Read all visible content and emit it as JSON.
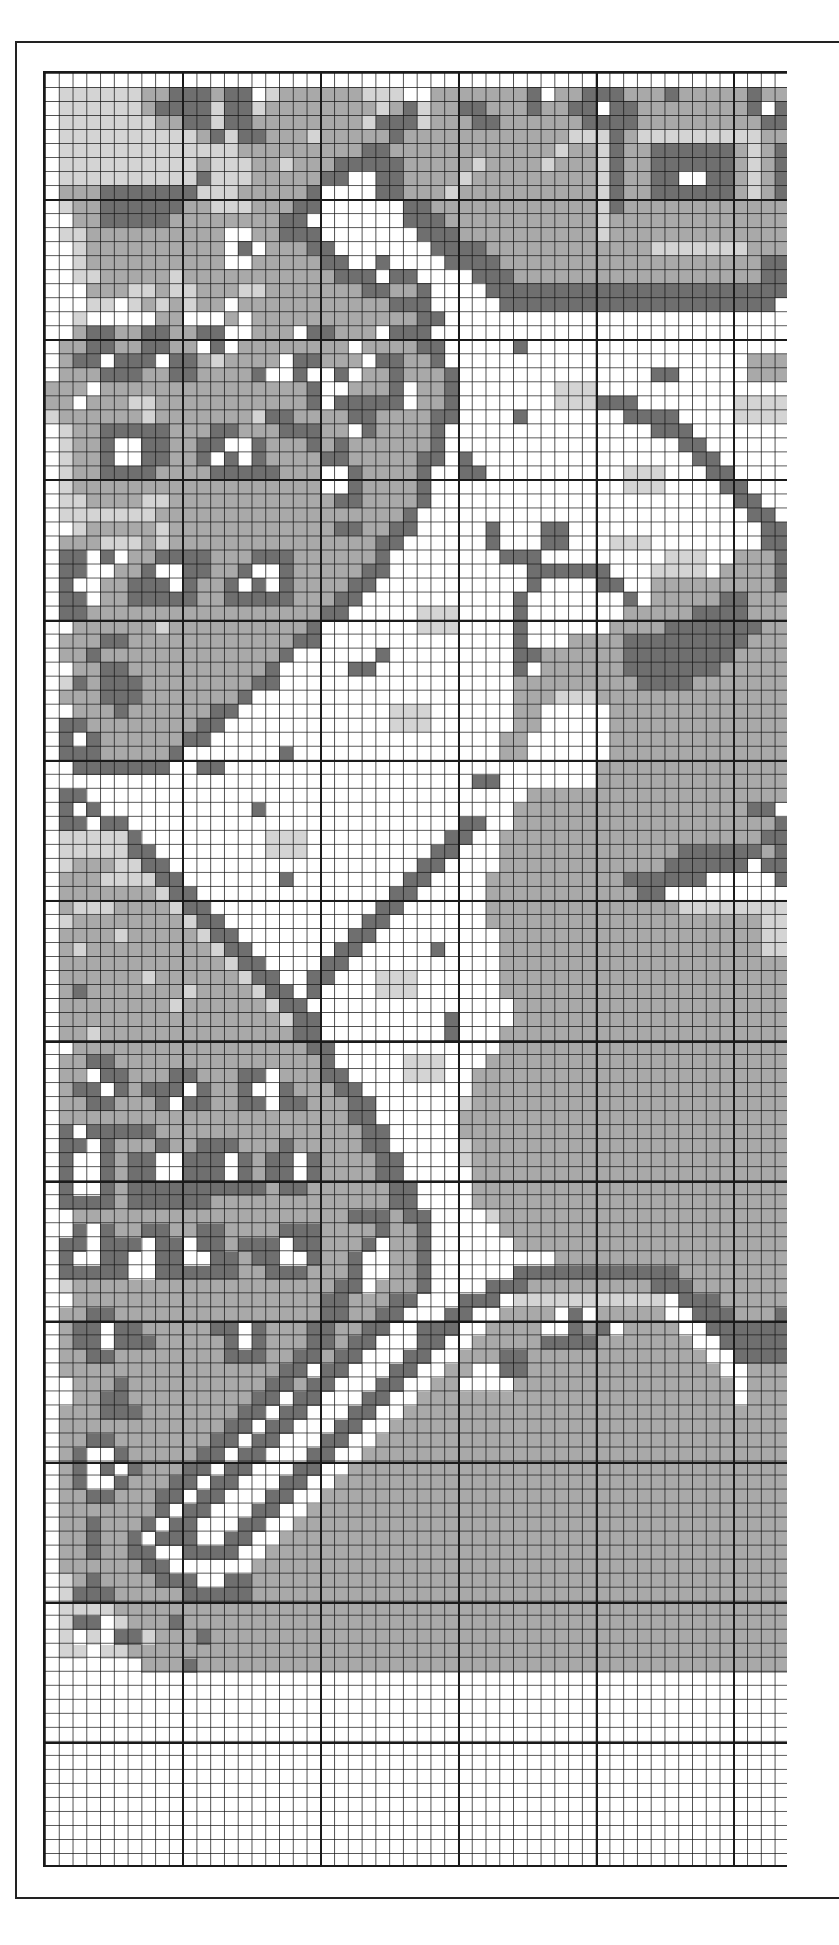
{
  "chart_data": {
    "type": "heatmap",
    "title": "",
    "columns": 54,
    "rows": 128,
    "heavy_line_every": 10,
    "heavy_col_offset": 10,
    "heavy_row_offset": 9,
    "legend": {
      ".": {
        "name": "white",
        "color": "#ffffff"
      },
      "l": {
        "name": "light-gray",
        "color": "#d4d4d4"
      },
      "m": {
        "name": "medium-gray",
        "color": "#a9a9a9"
      },
      "d": {
        "name": "dark-gray",
        "color": "#6f6f6f"
      }
    },
    "grid": [
      "......................................................",
      ".llllllmmdddmdd.lmmmmmmlll..mmmmmmmd.mmdddmmmdmmmmmdmm",
      ".llllllmddddlddlmmmmmmmmlmdlmmddmmmdmmdd.ddmmmmmmmmd.d",
      ".lllllllmmddlddmmmmmmmmldddlmmmddmmmmmmddddmmmmmmmmmdd",
      ".llllllllllmdlddmmmlmmmmmdmmmmmmmmmmmmllldmlllllllllmm",
      ".lllllllllllllmmmmmmmmmddmmmmmmmmmmmmlmmldmmddddddmlmd",
      ".llllllllllmlllmmlmmmdddddmmmmmlmmmmlmmmldmmddddddmlmd",
      ".lllllllllldlllmmmmmdd..ddmmmmlmmmmmmmmmldmmdd..ddmlmd",
      ".mmmdddddddlllmmmmmd....ddmmmlmmmmmmmmmmldmmddddddmlmd",
      ".lmmddddddmmlllmmmdd......ddmmmmmmmmmmmmldmmmmmmmmmmmm",
      "..mmdddddmmmmmmmmdd.......dddmmmmmmmmmmmlmmmmmmmmmmmmm",
      ".llmmmmmmmmmm..mmddd.......dddmmmmmmmmmmlmmmmmmmmmmmmm",
      "..lmmmmmmmmmm.d.mmmdd.......ddddmmmmmmmmmmmmlllllllmmm",
      "..lmmmmmmmmmm..mmmmmdd..d....ddddmmmmmmmmmmmmmmmmmmmdd",
      "..llmmmmmlmmmmmmmmmmmddd.dd....dddmmmmmmmmmmmmmmmmmmdd",
      "...mmmllmllmmmllmmmmmmmddmmd....dddddddddddddddddddddd",
      "...ll.lmlmlmm.mmmmmmmmmmmddd.....dddddddddddddddddddd.",
      "..l.....mm...m.mmmmmmmmmmmmdd.........................",
      "..mddmmddmmdd..mmm.ddmmm.ddd..........................",
      ".mmddmmddmm.d.mmmmmmmm.mmmmdd.....d...................",
      ".mdd.ddd.ddmlmmmm.ddmmm.ddmmd......................mmm",
      ".mmmdddmmddmmmmd..d..d.mmdmmmd..............dd.....mmm",
      "mmm.mmmmmmmmmmmmmmmd..mmmd.mmd.......lll..............",
      "mm.mmmllmmmmmmmmmmmd.ddddd.mmd.......lllddd.......llll",
      "lmmmmmmlmmmmmmmlddmmmmddmmmmdd....d.......dddd....llll",
      ".lmmdddddmmmddmmmdddmm.dmmmmd...............ddd.......",
      ".lmmd..ddmmdd..dmmmdmdmmmmmmd.................dd......",
      ".lmmd..ddmmd.d.dmmmmddmmmmmdd.d................dd.....",
      ".lmmddddmmmmdddddmmm..dmmmmd..dd..........lll...dd....",
      ".lmmmmmmmmmmmmmmmmmm..dmmmmd..............lll....dd...",
      ".llmmmmllmmmmmmmmmmmmddmmmmd......................dd..",
      ".lllllllmmmmmmmmmmmmmmmmmmd........................dd.",
      "..lmmmmmlmmmmmmmmmmmmddmmdd.....d...dd..............dd",
      ".mmmlllmlmmmmmmmmmmmmmmmdd......d...dd...lll........dd",
      ".dd.d.mmddddmmmdddmmmmmmd........ddd.........lll..mmmd",
      ".dd..mmd..ddmmd..dmmmmmdd..........dddddd...llll.mmmmd",
      ".d..mmddd.dmmd.d.dmmmmdd...........d....dd..mmmmmmmmmd",
      ".dd.mmdddddmmdddddmmmdd...........d.......d.mmmmmddmmm",
      ".ddmmmmmmmmmmmmmmmmmdd.....lll....d.......mmmmmddddmmm",
      "..mmmmmmlmmmmmmmmmmd.......lll....d......mmmmdddddddmm",
      ".mmmddmmmmmmmmmmmmdd..............d...mmmmdddddddddmmm",
      ".mmdmmmmmmmmmmmmmd......d.........ddmmmmmmddddddddmmmm",
      "..mmddmmmmmmmmmmd.....dd..........d.mmmmmmdddddddmmmmm",
      ".ldmdddmmmmmmmmdd.................mmmmmmmmmddddmmmmmmm",
      ".mmmdddmmmmmmmd...................mmmlllmmmmmmmmmmmmmm",
      "..mmmdmmmmmmdd...........lll......mm.....mmmmmmmmmmmmm",
      ".ddmmmmmmmmdd............lll......mm.....mmmmmmmmmmmmm",
      ".d.dmmmmmmdd.....................mm......mmmmmmmmmmmmm",
      ".dddmmmmmd.......d...............mm......mmmmmmmmmmmmm",
      "..ddddddd..dd...........................mmmmmmmmmmmmmm",
      "...............................dd.......mmmmmmmmmmmmmm",
      ".dd................................mmmmmmmmmmmmmmmmmmm",
      ".d.d...........d..................mmmmmmmmmmmmmmmmmdd",
      ".dd.dd........................dd..mmmmmmmmmmmmmmmmmmmd",
      ".llllld.........lll..........dd..mmmmmmmmmmmmmmmmmmmdd",
      ".llllldd........lll.........dd...mmmmmmmmmmmmmddddddmd",
      ".lmmmlldd..................dd....mmmmmmmmmmmmdddddd.dd",
      ".mmmlllldd.......d........dd....mmmmmmmmmmdddddd.....d",
      ".mmmmmmmldd..............dd.....mmmmmmmmmmmdd.........",
      ".mlllmmmmldd............dd......mmmmmmmmmmmmmmllllllll",
      ".lmmmmmmmmldd..........dd.......mmmmmmmmmmmmmmmmmmmmll",
      ".mmmmlmmmmmldd........dd.........mmmmmmmmmmmmmmmmmmmll",
      ".mlmmmmmmmmmldd......dd.....d....mmmmmmmmmmmmmmmmmmmll",
      ".mmmmmmmmmmmmldd....dd...........mmmmmmmmmmmmmmmmmmmmm",
      ".mmmmmmlmmmmmmldd..dd...lll......mmmmmmmmmmmmmmmmmmmmm",
      ".mdmmmmmmmlmmmmldd.d....lll......mmmmmmmmmmmmmmmmmmmmm",
      ".mmmmmmmmlmmmmmmldd...............mmmmmmmmmmmmmmmmmmmm",
      ".mmmmmmmmmmmmmmmmldd.........d....mmmmmmmmmmmmmmmmmmmm",
      ".mmlmmmmmmmmmmmmmmdd.........d...mmmmmmmmmmmmmmmmmmmmm",
      "..mmmmmmmmmmmmmmmmmdd............mmmmmmmmmmmmmmmmmmmmm",
      ".mmddmmmmmmmmmmmmmmmd.....lll...mmmmmmmmmmmmmmmmmmmmmm",
      ".mm.ddmmmddmmmdd.mmmdd....lll..mmmmmmmmmmmmmmmmmmmmmmm",
      ".mdd.dmddd.dmmd..dmmmdd........mmmmmmmmmmmmmmmmmmmmmmm",
      ".mmddmmmd.ddmmdd.ddmmmdd......lmmmmmmmmmmmmmmmmmmmmmmm",
      ".mmmmmmmmmmmmmmmmmmmmmdd......mmmmmmmmmmmmmmmmmmmmmmmm",
      ".d.dddddmmmmmmmmmmmmmmmdd.....mmmmmmmmmmmmmmmmmmmmmmmm",
      ".dd.dmmmdmmdddmmmdmmmmmdd.....lmmmmmmmmmmmmmmmmmmmmmmm",
      ".d..dmdd..ddd.dmdd.dmmmmdd....lmmmmmmmmmmmmmmmmmmmmmmm",
      ".d..dmdd..ddd.dmdd.dmmmmdd.....mmmmmmmmmmmmmmmmmmmmmmm",
      ".d..dmddddddddddmddmmmmmmdd....mmmmmmmmmmmmmmmmmmmmmmm",
      ".ddddmddddddmmmmmmmmmmmmmdd....mmmmmmmmmmmmmmmmmmmmmmm",
      "..mmmmmmmmmmmmmmmmmmmmdddmdd....lmmmmmmmmmmmmmmmmmmmmm",
      "..d.dmmddmmddmmmmdddmmmmdmmd.....mmmmmmmmmmmmmmmmmmmmm",
      ".dd.ddd.dd.ddmddd.ddmmmd.mmd......mmmmmmmmmmmmmmmmmmmm",
      ".d..dd..dd..ddmdd..dmmd..mmd.........mmmmmmmmmmmmmmmmm",
      ".ddddd..ddddddmmdddmmmd..mmd......ddddddddddddmmmmmmmm",
      ".lmmmmmmmmmmmmmmmmmmmdd.mmmd....dddmmmmmmmmmdddmmmmmmm",
      "..mmmmmmmmmmmmmmmmmmddmmmdd...ddd.lllllllllll.dddmmmmm",
      ".mmddmmmmmmmmmmmmmmmddmmdd...dd..mmmm.d.mmmmm..dddmmmd",
      ".mdd.ddmmmmmdd.dmmmddmmdd..ddd..mmmm..dmd.mmmm..dddddd",
      ".mdd.dddmmmmmd.dmmmddmdd...dd..mmmmmddddmmmmmmm..ddddd",
      ".mmddmmmmmmmmdddmmddmdd...dd..mmmddmmmmmmmmmmmmm..dddd",
      ".mmmmmmmmmmmmmmmmdd.dd...dd..mm..ddmmmmmmmmmmmmmm..mmm",
      "..mmmdmmmmmmmmmmddmdd...dd..mm....mmmmmmmmmmmmmmmm.mmm",
      "..mmddmmmmmmmmmdd.dd...dd..mmmmmmmmmmmmmmmmmmmmmmm.mmm",
      ".mmmdddmmmmmmmdd.dd...dd..mmmmmmmmmmmmmmmmmmmmmmmmmmmm",
      ".mmmmmmmmmmmmdd.dd...dd..mmmmmmmmmmmmmmmmmmmmmmmmmmmmm",
      ".mmddmmmmmmmdd.dd...dd..mmmmmmmmmmmmmmmmmmmmmmmmmmmmmm",
      ".md..dmmmmmdd.dd...dd..mmmmmmmmmmmmmmmmmmmmmmmmmmmmmmm",
      ".md.d.dmmmdd.dd...dd..mmmmmmmmmmmmmmmmmmmmmmmmmmmmmmmm",
      ".md..dmmmdd.dd...dd..mmmmmmmmmmmmmmmmmmmmmmmmmmmmmmmmm",
      ".mmddmmmdd.dd...dd..mmmmmmmmmmmmmmmmmmmmmmmmmmmmmmmmmm",
      ".mmmmmmmd.dd...dd..mmmmmmmmmmmmmmmmmmmmmmmmmmmmmmmmmmm",
      ".mmdmmmd.dd...dd..mmmmmmmmmmmmmmmmmmmmmmmmmmmmmmmmmmmm",
      ".mmdmmd.ddd..dd..mmmmmmmmmmmmmmmmmmmmmmmmmmmmmmmmmmmmm",
      ".mmdmmdd..dddd..mmmmmmmmmmmmmmmmmmmmmmmmmmmmmmmmmmmmmm",
      ".mmmmmmdd......mmmmmmmmmmmmmmmmmmmmmmmmmmmmmmmmmmmmmmm",
      ".lmdmmmmddd..ddmmmmmmmmmmmmmmmmmmmmmmmmmmmmmmmmmmmmmmm",
      ".ldddmmmmmdddddmmmmmmmmmmmmmmmmmmmmmmmmmmmmmmmmmmmmmmm",
      ".llllmmmmmmmmmmmmmmmmmmmmmmmmmmmmmmmmmmmmmmmmmmmmmmmmm",
      ".ldd.lmmmdmmmmmmmmmmmmmmmmmmmmmmmmmmmmmmmmmmmmmmmmmmmm",
      ".l.l.ddlmmmdmmmmmmmmmmmmmmmmmmmmmmmmmmmmmmmmmmmmmmmmmm",
      ".ll.llmmmmmmmmmmmmmmmmmmmmmmmmmmmmmmmmmmmmmmmmmmmmmmmm",
      ".......mmmdmmmmmmmmmmmmmmmmmmmmmmmmmmmmmmmmmmmmmmmmmmm",
      "......................................................"
    ]
  }
}
